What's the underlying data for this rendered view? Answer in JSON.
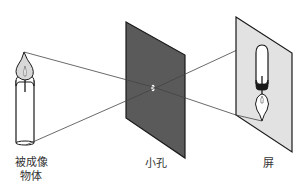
{
  "labels": {
    "object_line1": "被成像",
    "object_line2": "物体",
    "pinhole": "小孔",
    "screen": "屏"
  },
  "colors": {
    "pinhole_board": "#5a5a5a",
    "screen_fill": "#e2e2e2",
    "outline": "#1a1a1a",
    "ray": "#444444",
    "flame_fill": "#d8d8d8",
    "background": "#ffffff"
  },
  "elements": {
    "object": "candle (upright)",
    "image": "candle (inverted)",
    "rays": [
      "flame tip to pinhole to bottom of image",
      "candle base to pinhole to top of image"
    ]
  }
}
